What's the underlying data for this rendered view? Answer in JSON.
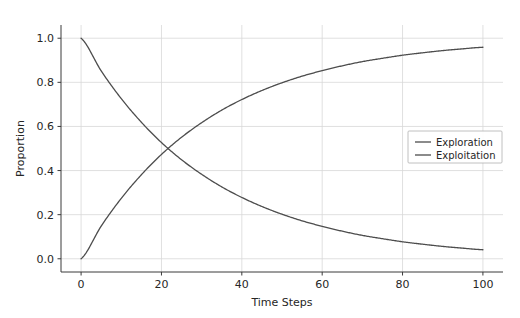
{
  "chart_data": {
    "type": "line",
    "title": "",
    "xlabel": "Time Steps",
    "ylabel": "Proportion",
    "xlim": [
      -5,
      105
    ],
    "ylim": [
      -0.06,
      1.06
    ],
    "xticks": [
      0,
      20,
      40,
      60,
      80,
      100
    ],
    "xtick_labels": [
      "0",
      "20",
      "40",
      "60",
      "80",
      "100"
    ],
    "yticks": [
      0.0,
      0.2,
      0.4,
      0.6,
      0.8,
      1.0
    ],
    "ytick_labels": [
      "0.0",
      "0.2",
      "0.4",
      "0.6",
      "0.8",
      "1.0"
    ],
    "grid": true,
    "legend_position": "center right",
    "x": [
      0,
      5,
      10,
      15,
      20,
      25,
      30,
      35,
      40,
      45,
      50,
      55,
      60,
      65,
      70,
      75,
      80,
      85,
      90,
      95,
      100
    ],
    "series": [
      {
        "name": "Exploration",
        "color": "#4d4d4d",
        "values": [
          1.0,
          0.852,
          0.726,
          0.619,
          0.527,
          0.449,
          0.383,
          0.326,
          0.278,
          0.237,
          0.202,
          0.172,
          0.147,
          0.125,
          0.106,
          0.091,
          0.077,
          0.066,
          0.056,
          0.048,
          0.041
        ]
      },
      {
        "name": "Exploitation",
        "color": "#4d4d4d",
        "values": [
          0.0,
          0.148,
          0.274,
          0.381,
          0.473,
          0.551,
          0.617,
          0.674,
          0.722,
          0.763,
          0.798,
          0.828,
          0.853,
          0.875,
          0.894,
          0.909,
          0.923,
          0.934,
          0.944,
          0.952,
          0.959
        ]
      }
    ],
    "annotations": {
      "crossing_point": {
        "x": 21,
        "y": 0.5
      }
    }
  },
  "legend": {
    "entries": [
      {
        "label": "Exploration"
      },
      {
        "label": "Exploitation"
      }
    ]
  }
}
